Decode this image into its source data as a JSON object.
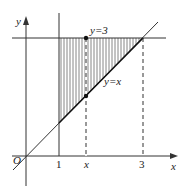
{
  "figure": {
    "axis_labels": {
      "x": "x",
      "y": "y",
      "origin": "O"
    },
    "tick_labels": {
      "one": "1",
      "x": "x",
      "three": "3"
    },
    "line_labels": {
      "horizontal": "y=3",
      "diagonal": "y=x"
    },
    "colors": {
      "line": "#333333",
      "hatch": "#555555"
    }
  }
}
